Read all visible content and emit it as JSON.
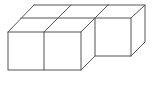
{
  "diagram": {
    "type": "isometric-cube-arrangement",
    "cube_count": 3,
    "stroke_color": "#555555",
    "background_color": "#ffffff",
    "cubes": [
      {
        "name": "front-left",
        "row": "front",
        "col": 0
      },
      {
        "name": "front-middle",
        "row": "front",
        "col": 1
      },
      {
        "name": "back-right",
        "row": "back",
        "col": 2
      }
    ]
  }
}
